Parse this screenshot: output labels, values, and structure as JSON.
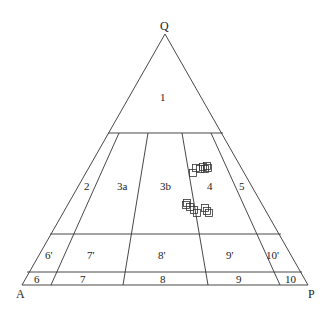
{
  "diagram": {
    "type": "QAP ternary classification diagram",
    "corners": {
      "top": "Q",
      "left": "A",
      "right": "P"
    },
    "fields": {
      "f1": "1",
      "f2": "2",
      "f3a": "3a",
      "f3b": "3b",
      "f4": "4",
      "f5": "5",
      "f6p": "6'",
      "f7p": "7'",
      "f8p": "8'",
      "f9p": "9'",
      "f10p": "10'",
      "f6": "6",
      "f7": "7",
      "f8": "8",
      "f9": "9",
      "f10": "10"
    },
    "samples": {
      "marker": "open-square",
      "cluster_upper": [
        [
          193,
          173
        ],
        [
          196,
          168
        ],
        [
          200,
          169
        ],
        [
          203,
          167
        ],
        [
          205,
          169
        ],
        [
          207,
          166
        ],
        [
          208,
          168
        ]
      ],
      "cluster_lower": [
        [
          186,
          205
        ],
        [
          187,
          203
        ],
        [
          190,
          207
        ],
        [
          194,
          210
        ],
        [
          197,
          213
        ],
        [
          205,
          208
        ],
        [
          207,
          211
        ],
        [
          209,
          213
        ]
      ]
    }
  }
}
